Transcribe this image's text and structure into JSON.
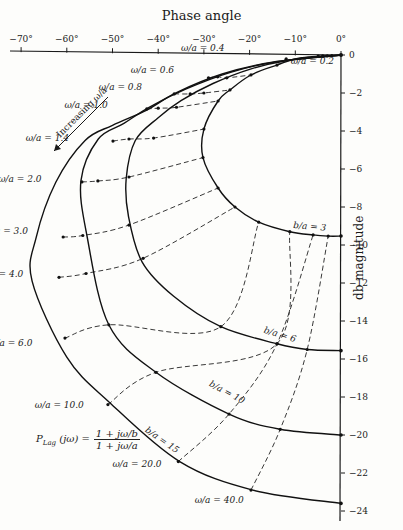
{
  "chart_data": {
    "type": "line",
    "title": "Phase angle",
    "xlabel": "Phase angle",
    "ylabel": "db magnitude",
    "xlim": [
      -72,
      0
    ],
    "ylim": [
      -24,
      0
    ],
    "x_ticks": [
      -70,
      -60,
      -50,
      -40,
      -30,
      -20,
      -10,
      0
    ],
    "x_tick_labels": [
      "−70°",
      "−60°",
      "−50°",
      "−40°",
      "−30°",
      "−20°",
      "−10°",
      "0°"
    ],
    "y_ticks": [
      0,
      -2,
      -4,
      -6,
      -8,
      -10,
      -12,
      -14,
      -16,
      -18,
      -20,
      -22,
      -24
    ],
    "y_tick_labels": [
      "0",
      "−2",
      "−4",
      "−6",
      "−8",
      "−10",
      "−12",
      "−14",
      "−16",
      "−18",
      "−20",
      "−22",
      "−24"
    ],
    "grid": false,
    "series": [
      {
        "name": "b/a = 3",
        "style": "solid",
        "label_at": [
          -10.5,
          -9.1
        ],
        "label_rot": 5,
        "points": [
          [
            0,
            0
          ],
          [
            -9,
            -0.16
          ],
          [
            -14,
            -0.53
          ],
          [
            -19.7,
            -1.05
          ],
          [
            -24.3,
            -1.84
          ],
          [
            -26.9,
            -2.42
          ],
          [
            -30,
            -3.9
          ],
          [
            -30.2,
            -5.4
          ],
          [
            -26.9,
            -7.0
          ],
          [
            -23.2,
            -8.0
          ],
          [
            -18,
            -8.8
          ],
          [
            -11.2,
            -9.3
          ],
          [
            -6.1,
            -9.47
          ],
          [
            -2.8,
            -9.53
          ],
          [
            0,
            -9.53
          ]
        ]
      },
      {
        "name": "b/a = 6",
        "style": "solid",
        "label_at": [
          -17,
          -14.6
        ],
        "label_rot": 17,
        "points": [
          [
            0,
            0
          ],
          [
            -12,
            -0.3
          ],
          [
            -20,
            -0.75
          ],
          [
            -28,
            -1.5
          ],
          [
            -35,
            -2.4
          ],
          [
            -40,
            -3.3
          ],
          [
            -45,
            -4.5
          ],
          [
            -47,
            -6.5
          ],
          [
            -46.5,
            -8.5
          ],
          [
            -43.5,
            -10.9
          ],
          [
            -36.6,
            -12.7
          ],
          [
            -26.3,
            -14.3
          ],
          [
            -14,
            -15.2
          ],
          [
            -7.4,
            -15.5
          ],
          [
            0,
            -15.56
          ]
        ]
      },
      {
        "name": "b/a = 10",
        "style": "solid",
        "label_at": [
          -29,
          -17.4
        ],
        "label_rot": 28,
        "points": [
          [
            0,
            0
          ],
          [
            -14,
            -0.35
          ],
          [
            -24,
            -0.9
          ],
          [
            -34,
            -1.8
          ],
          [
            -42,
            -2.75
          ],
          [
            -47.5,
            -3.6
          ],
          [
            -53.1,
            -4.42
          ],
          [
            -56.9,
            -6.6
          ],
          [
            -55.6,
            -9.5
          ],
          [
            -50.8,
            -14.2
          ],
          [
            -40.5,
            -16.7
          ],
          [
            -24.5,
            -18.9
          ],
          [
            -13.3,
            -19.7
          ],
          [
            0,
            -20.0
          ]
        ]
      },
      {
        "name": "b/a = 15",
        "style": "solid",
        "label_at": [
          -43,
          -19.8
        ],
        "label_rot": 35,
        "points": [
          [
            0,
            0
          ],
          [
            -15,
            -0.38
          ],
          [
            -26,
            -1.0
          ],
          [
            -36,
            -1.98
          ],
          [
            -42.5,
            -2.9
          ],
          [
            -50,
            -3.7
          ],
          [
            -56,
            -4.5
          ],
          [
            -62.4,
            -6.7
          ],
          [
            -66.7,
            -9.6
          ],
          [
            -67.6,
            -11.9
          ],
          [
            -60,
            -15.9
          ],
          [
            -50.6,
            -18.3
          ],
          [
            -35.3,
            -21.4
          ],
          [
            -19.3,
            -22.9
          ],
          [
            0,
            -23.6
          ]
        ]
      }
    ],
    "omega_lines": [
      {
        "label": "ω/a = 0.2",
        "label_at": [
          -11,
          -0.45
        ],
        "points": [
          [
            -2,
            -0.03
          ],
          [
            -3,
            -0.05
          ],
          [
            -4,
            -0.05
          ],
          [
            -5,
            -0.06
          ]
        ]
      },
      {
        "label": "ω/a = 0.4",
        "label_at": [
          -35,
          0.2
        ],
        "points": [
          [
            -12,
            -0.2
          ],
          [
            -14,
            -0.53
          ]
        ]
      },
      {
        "label": "ω/a = 0.6",
        "label_at": [
          -46,
          -0.95
        ],
        "points": [
          [
            -29,
            -1.2
          ],
          [
            -27,
            -1.15
          ],
          [
            -25,
            -1.2
          ],
          [
            -19.7,
            -1.05
          ]
        ]
      },
      {
        "label": "ω/a = 0.8",
        "label_at": [
          -53,
          -1.85
        ],
        "points": [
          [
            -36.5,
            -2.05
          ],
          [
            -33,
            -2.05
          ],
          [
            -30,
            -2.0
          ],
          [
            -24.3,
            -1.84
          ]
        ]
      },
      {
        "label": "ω/a = 1.0",
        "label_at": [
          -60.5,
          -2.8
        ],
        "points": [
          [
            -42.5,
            -2.84
          ],
          [
            -40,
            -2.8
          ],
          [
            -36,
            -2.75
          ],
          [
            -26.9,
            -2.42
          ]
        ]
      },
      {
        "label": "ω/a = 1.4",
        "label_at": [
          -69,
          -4.5
        ],
        "points": [
          [
            -49.9,
            -4.53
          ],
          [
            -46.4,
            -4.42
          ],
          [
            -41,
            -4.37
          ],
          [
            -30,
            -3.9
          ]
        ]
      },
      {
        "label": "ω/a = 2.0",
        "label_at": [
          -75,
          -6.7
        ],
        "points": [
          [
            -56.7,
            -6.68
          ],
          [
            -53.2,
            -6.63
          ],
          [
            -46.4,
            -6.42
          ],
          [
            -30.2,
            -5.4
          ]
        ]
      },
      {
        "label": "ω/a = 3.0",
        "label_at": [
          -78,
          -9.4
        ],
        "points": [
          [
            -60.8,
            -9.58
          ],
          [
            -56.5,
            -9.5
          ],
          [
            -46.4,
            -8.95
          ],
          [
            -26.9,
            -7.0
          ]
        ]
      },
      {
        "label": "ω/a = 4.0",
        "label_at": [
          -79,
          -11.7
        ],
        "points": [
          [
            -61.7,
            -11.7
          ],
          [
            -55.8,
            -11.5
          ],
          [
            -43.3,
            -10.7
          ],
          [
            -23.2,
            -8.0
          ]
        ]
      },
      {
        "label": "ω/a = 6.0",
        "label_at": [
          -77,
          -15.3
        ],
        "points": [
          [
            -60.4,
            -14.9
          ],
          [
            -50.8,
            -14.2
          ],
          [
            -26.3,
            -14.3
          ],
          [
            -18,
            -8.8
          ]
        ]
      },
      {
        "label": "ω/a = 10.0",
        "label_at": [
          -67,
          -18.6
        ],
        "points": [
          [
            -51,
            -18.4
          ],
          [
            -40.5,
            -16.7
          ],
          [
            -14,
            -15.2
          ],
          [
            -11.2,
            -9.3
          ]
        ]
      },
      {
        "label": "ω/a = 20.0",
        "label_at": [
          -50,
          -21.7
        ],
        "points": [
          [
            -35.6,
            -21.4
          ],
          [
            -24.5,
            -18.9
          ],
          [
            -14,
            -15.2
          ],
          [
            -6.1,
            -9.47
          ]
        ]
      },
      {
        "label": "ω/a = 40.0",
        "label_at": [
          -32,
          -23.6
        ],
        "points": [
          [
            -19.7,
            -22.9
          ],
          [
            -13.3,
            -19.7
          ],
          [
            -7.4,
            -15.5
          ],
          [
            -2.8,
            -9.53
          ]
        ]
      }
    ],
    "annotations": [
      {
        "text": "Increasing ω/a",
        "type": "arrow",
        "from": [
          -51,
          -2.2
        ],
        "to": [
          -63,
          -5.1
        ]
      },
      {
        "text": "P_Lag(jω) = (1 + jω/b) / (1 + jω/a)",
        "type": "formula"
      }
    ]
  },
  "labels": {
    "title": "Phase angle",
    "ylabel": "db magnitude",
    "increasing": "Increasing ω/a",
    "formula_lhs": "P",
    "formula_sub": "Lag",
    "formula_arg": "(jω)  =",
    "formula_num": "1 + jω/b",
    "formula_den": "1 + jω/a"
  }
}
